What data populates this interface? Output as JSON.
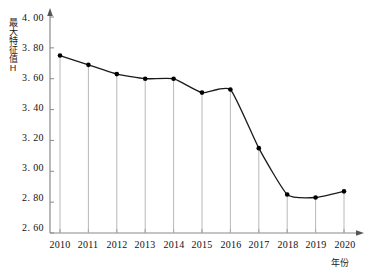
{
  "chart_data": {
    "type": "line",
    "title": "",
    "xlabel": "年份",
    "ylabel": "最大特征值H",
    "categories": [
      "2010",
      "2011",
      "2012",
      "2013",
      "2014",
      "2015",
      "2016",
      "2017",
      "2018",
      "2019",
      "2020"
    ],
    "values": [
      3.75,
      3.69,
      3.63,
      3.6,
      3.6,
      3.51,
      3.53,
      3.15,
      2.85,
      2.83,
      2.87
    ],
    "series": [
      {
        "name": "最大特征值H",
        "values": [
          3.75,
          3.69,
          3.63,
          3.6,
          3.6,
          3.51,
          3.53,
          3.15,
          2.85,
          2.83,
          2.87
        ]
      }
    ],
    "ylim": [
      2.6,
      4.0
    ],
    "ytick_labels": [
      "4. 00",
      "3. 80",
      "3. 60",
      "3. 40",
      "3. 20",
      "3. 00",
      "2. 80",
      "2. 60"
    ],
    "ytick_values": [
      4.0,
      3.8,
      3.6,
      3.4,
      3.2,
      3.0,
      2.8,
      2.6
    ],
    "grid": false,
    "legend": "none",
    "marker": "filled-circle",
    "drop_lines": true,
    "line_color": "#1a1a1a",
    "marker_color": "#000000",
    "axis_color": "#8a8a8a",
    "droplin_color": "#b0b0b0"
  },
  "axes": {
    "y_axis_title": "最大特征值H",
    "x_axis_title": "年份"
  }
}
